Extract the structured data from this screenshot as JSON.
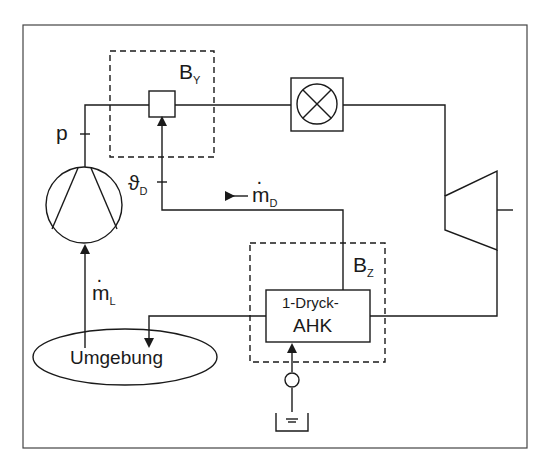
{
  "diagram": {
    "type": "process-schematic",
    "colors": {
      "line": "#1a1a1a",
      "background": "#ffffff"
    },
    "labels": {
      "pressure": "p",
      "temp": {
        "symbol": "ϑ",
        "sub": "D"
      },
      "steam_flow": {
        "symbol": "m",
        "sub": "D"
      },
      "air_flow": {
        "symbol": "m",
        "sub": "L"
      },
      "boundary_y": {
        "symbol": "B",
        "sub": "Y"
      },
      "boundary_z": {
        "symbol": "B",
        "sub": "Z"
      },
      "hrsg_line1": "1-Dryck-",
      "hrsg_line2": "AHK",
      "environment": "Umgebung"
    },
    "components": [
      {
        "name": "compressor",
        "symbol": "circle-with-trapezoid"
      },
      {
        "name": "mixing-node",
        "symbol": "square"
      },
      {
        "name": "combustion-chamber",
        "symbol": "circle-cross-in-box"
      },
      {
        "name": "turbine",
        "symbol": "trapezoid"
      },
      {
        "name": "heat-recovery-steam-generator",
        "label": "1-Dryck-AHK"
      },
      {
        "name": "feed-pump",
        "symbol": "small-circle"
      },
      {
        "name": "water-tank",
        "symbol": "tank"
      },
      {
        "name": "environment",
        "label": "Umgebung"
      }
    ]
  }
}
